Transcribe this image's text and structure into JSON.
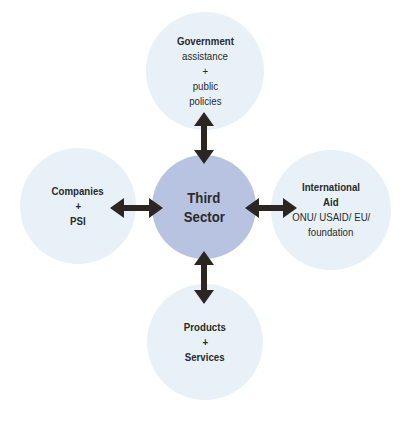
{
  "diagram": {
    "center": {
      "lines": [
        "Third",
        "Sector"
      ],
      "color": "#b7c3e0"
    },
    "nodes": {
      "top": {
        "title": "Government",
        "lines": [
          "assistance",
          "+",
          "public",
          "policies"
        ]
      },
      "left": {
        "title": "Companies",
        "lines": [
          "+",
          "PSI"
        ]
      },
      "right": {
        "title_lines": [
          "International",
          "Aid"
        ],
        "lines": [
          "ONU/ USAID/ EU/",
          "foundation"
        ]
      },
      "bottom": {
        "title": "Products",
        "lines": [
          "+",
          "Services"
        ]
      }
    },
    "outer_color": "#e8f1f8",
    "arrow_color": "#2b2622",
    "edges": [
      {
        "from": "center",
        "to": "top",
        "type": "bidirectional"
      },
      {
        "from": "center",
        "to": "left",
        "type": "bidirectional"
      },
      {
        "from": "center",
        "to": "right",
        "type": "bidirectional"
      },
      {
        "from": "center",
        "to": "bottom",
        "type": "bidirectional"
      }
    ]
  }
}
